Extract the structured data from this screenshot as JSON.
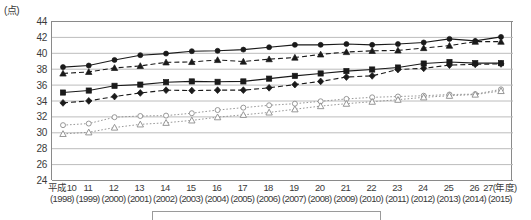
{
  "axis": {
    "unit_label": "(点)",
    "y_ticks": [
      44,
      42,
      40,
      38,
      36,
      34,
      32,
      30,
      28,
      26,
      24
    ],
    "y_min": 24,
    "y_max": 44,
    "y_step": 2,
    "x_era_labels": [
      "平成10",
      "11",
      "12",
      "13",
      "14",
      "15",
      "16",
      "17",
      "18",
      "19",
      "20",
      "21",
      "22",
      "23",
      "24",
      "25",
      "26",
      "27(年度)"
    ],
    "x_year_labels": [
      "(1998)",
      "(1999)",
      "(2000)",
      "(2001)",
      "(2002)",
      "(2003)",
      "(2004)",
      "(2005)",
      "(2006)",
      "(2007)",
      "(2008)",
      "(2009)",
      "(2010)",
      "(2011)",
      "(2012)",
      "(2013)",
      "(2014)",
      "(2015)"
    ]
  },
  "chart_data": {
    "type": "line",
    "title": "",
    "subtitle": "",
    "xlabel": "",
    "ylabel": "(点)",
    "ylim": [
      24,
      44
    ],
    "ytick_step": 2,
    "grid": true,
    "legend_position": "bottom",
    "x": [
      "平成10(1998)",
      "11(1999)",
      "12(2000)",
      "13(2001)",
      "14(2002)",
      "15(2003)",
      "16(2004)",
      "17(2005)",
      "18(2006)",
      "19(2007)",
      "20(2008)",
      "21(2009)",
      "22(2010)",
      "23(2011)",
      "24(2012)",
      "25(2013)",
      "26(2014)",
      "27(2015)"
    ],
    "series": [
      {
        "name": "series-1",
        "marker": "filled-circle",
        "line_style": "solid",
        "color": "#1a1a1a",
        "values": [
          38.2,
          38.4,
          39.1,
          39.7,
          39.9,
          40.2,
          40.25,
          40.4,
          40.7,
          41.0,
          41.0,
          41.1,
          41.0,
          41.1,
          41.3,
          41.75,
          41.5,
          42.0
        ]
      },
      {
        "name": "series-2",
        "marker": "filled-triangle",
        "line_style": "dashed",
        "color": "#1a1a1a",
        "values": [
          37.4,
          37.6,
          38.1,
          38.35,
          38.8,
          38.85,
          39.1,
          38.9,
          39.2,
          39.4,
          39.8,
          40.1,
          40.25,
          40.3,
          40.6,
          40.9,
          41.4,
          41.4
        ]
      },
      {
        "name": "series-3",
        "marker": "filled-square",
        "line_style": "solid",
        "color": "#1a1a1a",
        "values": [
          35.0,
          35.25,
          35.85,
          36.0,
          36.3,
          36.4,
          36.35,
          36.4,
          36.75,
          37.1,
          37.4,
          37.7,
          37.9,
          38.15,
          38.65,
          38.85,
          38.7,
          38.7
        ]
      },
      {
        "name": "series-4",
        "marker": "filled-diamond",
        "line_style": "dashed",
        "color": "#1a1a1a",
        "values": [
          33.7,
          33.95,
          34.5,
          34.95,
          35.3,
          35.25,
          35.3,
          35.3,
          35.6,
          36.0,
          36.4,
          36.95,
          37.1,
          37.9,
          38.05,
          38.45,
          38.55,
          38.6
        ]
      },
      {
        "name": "series-5",
        "marker": "open-circle",
        "line_style": "dotted",
        "color": "#8c8c8c",
        "values": [
          30.9,
          31.1,
          31.9,
          32.05,
          32.1,
          32.4,
          32.8,
          33.1,
          33.4,
          33.6,
          33.9,
          34.2,
          34.4,
          34.5,
          34.6,
          34.75,
          34.8,
          35.4
        ]
      },
      {
        "name": "series-6",
        "marker": "open-triangle",
        "line_style": "dotted",
        "color": "#8c8c8c",
        "values": [
          29.8,
          30.0,
          30.6,
          31.0,
          31.2,
          31.5,
          31.9,
          32.2,
          32.5,
          32.9,
          33.3,
          33.6,
          33.85,
          34.1,
          34.4,
          34.6,
          34.75,
          35.2
        ]
      }
    ]
  }
}
